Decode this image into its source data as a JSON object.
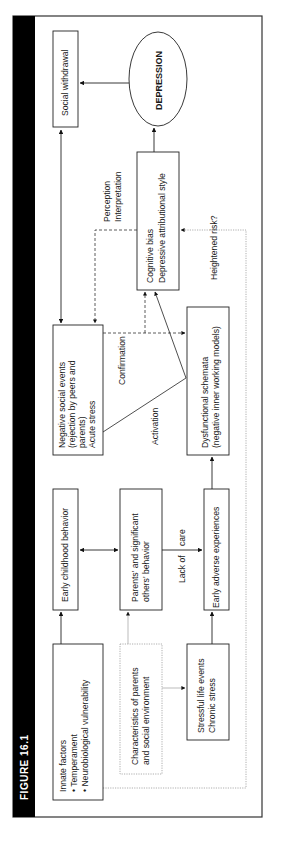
{
  "figure": {
    "title": "FIGURE 16.1",
    "orientation": "rotated 90deg counter-clockwise"
  },
  "nodes": {
    "social_withdrawal": {
      "lines": [
        "Social withdrawal"
      ]
    },
    "depression": {
      "lines": [
        "DEPRESSION"
      ],
      "shape": "ellipse"
    },
    "cognitive_bias": {
      "lines": [
        "Cognitive bias",
        "Depressive attributional style"
      ]
    },
    "negative_social_events": {
      "lines": [
        "Negative social events",
        "(rejection by peers and",
        "parents)",
        "Acute stress"
      ]
    },
    "dysfunctional_schemata": {
      "lines": [
        "Dysfunctional schemata",
        "(negative inner working models)"
      ]
    },
    "early_childhood_behavior": {
      "lines": [
        "Early childhood behavior"
      ]
    },
    "parents_behavior": {
      "lines": [
        "Parents' and significant",
        "others' behavior"
      ]
    },
    "early_adverse_experiences": {
      "lines": [
        "Early adverse experiences"
      ]
    },
    "innate_factors": {
      "lines": [
        "Innate factors",
        "•  Temperament",
        "•  Neurobiological vulnerability"
      ]
    },
    "characteristics_parents": {
      "lines": [
        "Characteristics of parents",
        "and social environment"
      ],
      "border": "dotted"
    },
    "stressful_life_events": {
      "lines": [
        "Stressful life events",
        "Chronic stress"
      ]
    }
  },
  "edge_labels": {
    "perception": [
      "Perception",
      "Interpretation"
    ],
    "confirmation": "Confirmation",
    "activation": "Activation",
    "lack_of_care": [
      "Lack of",
      "care"
    ],
    "heightened_risk": "Heightened risk?"
  },
  "colors": {
    "title_bar": "#000000",
    "line": "#1a1a1a",
    "dotted_line": "#9a9a9a",
    "background": "#ffffff"
  }
}
